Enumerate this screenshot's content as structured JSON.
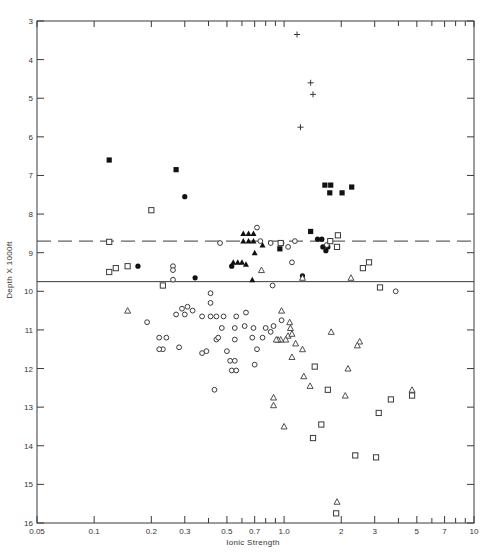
{
  "chart_data": {
    "type": "scatter",
    "title": "",
    "xlabel": "Ionic Strength",
    "ylabel": "Depth X 1000ft",
    "xscale": "log",
    "xlim": [
      0.05,
      10
    ],
    "ylim": [
      16,
      3
    ],
    "y_inverted": true,
    "grid": false,
    "legend": "none",
    "x_tick_labels": [
      "0.05",
      "0.1",
      "0.2",
      "0.3",
      "0.5",
      "0.7",
      "1.0",
      "2",
      "3",
      "5",
      "7",
      "10"
    ],
    "x_tick_values": [
      0.05,
      0.1,
      0.2,
      0.3,
      0.5,
      0.7,
      1.0,
      2,
      3,
      5,
      7,
      10
    ],
    "x_minor_ticks": [
      0.4,
      0.6,
      0.8,
      0.9,
      4,
      6,
      8,
      9
    ],
    "y_tick_labels": [
      "3",
      "4",
      "5",
      "6",
      "7",
      "8",
      "9",
      "10",
      "11",
      "12",
      "13",
      "14",
      "15",
      "16"
    ],
    "y_tick_values": [
      3,
      4,
      5,
      6,
      7,
      8,
      9,
      10,
      11,
      12,
      13,
      14,
      15,
      16
    ],
    "reference_lines": [
      {
        "style": "dashed",
        "depth": 8.7
      },
      {
        "style": "solid",
        "depth": 9.75
      }
    ],
    "series": [
      {
        "name": "plus",
        "marker": "plus",
        "points": [
          [
            1.17,
            3.35
          ],
          [
            1.38,
            4.6
          ],
          [
            1.42,
            4.9
          ],
          [
            1.22,
            5.75
          ]
        ]
      },
      {
        "name": "filled-square",
        "marker": "filled-square",
        "points": [
          [
            0.12,
            6.6
          ],
          [
            0.27,
            6.85
          ],
          [
            1.64,
            7.25
          ],
          [
            1.76,
            7.25
          ],
          [
            1.74,
            7.45
          ],
          [
            2.02,
            7.45
          ],
          [
            2.27,
            7.3
          ],
          [
            1.38,
            8.45
          ],
          [
            0.95,
            8.9
          ]
        ]
      },
      {
        "name": "filled-circle",
        "marker": "filled-circle",
        "points": [
          [
            0.3,
            7.55
          ],
          [
            0.17,
            9.35
          ],
          [
            0.53,
            9.35
          ],
          [
            0.34,
            9.65
          ],
          [
            1.5,
            8.65
          ],
          [
            1.58,
            8.65
          ],
          [
            1.6,
            8.85
          ],
          [
            1.66,
            8.95
          ],
          [
            1.7,
            8.85
          ],
          [
            1.25,
            9.6
          ]
        ]
      },
      {
        "name": "filled-triangle",
        "marker": "filled-triangle",
        "points": [
          [
            0.61,
            8.5
          ],
          [
            0.65,
            8.5
          ],
          [
            0.69,
            8.5
          ],
          [
            0.61,
            8.7
          ],
          [
            0.65,
            8.7
          ],
          [
            0.69,
            8.7
          ],
          [
            0.7,
            9.0
          ],
          [
            0.77,
            8.8
          ],
          [
            0.54,
            9.25
          ],
          [
            0.57,
            9.25
          ],
          [
            0.6,
            9.25
          ],
          [
            0.63,
            9.3
          ],
          [
            0.68,
            9.7
          ]
        ]
      },
      {
        "name": "open-circle",
        "marker": "open-circle",
        "points": [
          [
            0.72,
            8.35
          ],
          [
            0.75,
            8.7
          ],
          [
            0.46,
            8.75
          ],
          [
            0.97,
            8.75
          ],
          [
            1.05,
            8.85
          ],
          [
            1.14,
            8.7
          ],
          [
            0.85,
            8.75
          ],
          [
            1.68,
            8.8
          ],
          [
            0.26,
            9.35
          ],
          [
            0.26,
            9.45
          ],
          [
            0.26,
            9.7
          ],
          [
            1.1,
            9.25
          ],
          [
            0.87,
            9.85
          ],
          [
            3.87,
            10.0
          ],
          [
            0.41,
            10.05
          ],
          [
            0.41,
            10.3
          ],
          [
            0.31,
            10.4
          ],
          [
            0.29,
            10.45
          ],
          [
            0.33,
            10.5
          ],
          [
            0.3,
            10.6
          ],
          [
            0.27,
            10.6
          ],
          [
            0.37,
            10.65
          ],
          [
            0.41,
            10.65
          ],
          [
            0.44,
            10.65
          ],
          [
            0.48,
            10.65
          ],
          [
            0.56,
            10.65
          ],
          [
            0.19,
            10.8
          ],
          [
            0.63,
            10.55
          ],
          [
            0.24,
            11.2
          ],
          [
            0.22,
            11.2
          ],
          [
            0.44,
            11.25
          ],
          [
            0.55,
            11.25
          ],
          [
            0.39,
            11.55
          ],
          [
            0.37,
            11.6
          ],
          [
            0.5,
            11.55
          ],
          [
            0.68,
            11.2
          ],
          [
            0.7,
            11.9
          ],
          [
            0.77,
            11.2
          ],
          [
            0.72,
            11.5
          ],
          [
            0.23,
            11.5
          ],
          [
            0.22,
            11.5
          ],
          [
            0.28,
            11.45
          ],
          [
            0.45,
            11.2
          ],
          [
            0.52,
            11.8
          ],
          [
            0.55,
            11.8
          ],
          [
            0.62,
            10.9
          ],
          [
            0.69,
            10.95
          ],
          [
            0.8,
            10.95
          ],
          [
            0.85,
            11.05
          ],
          [
            0.88,
            10.9
          ],
          [
            0.97,
            10.75
          ],
          [
            0.53,
            12.05
          ],
          [
            0.56,
            12.05
          ],
          [
            0.43,
            12.55
          ],
          [
            0.47,
            10.95
          ],
          [
            0.55,
            10.95
          ]
        ]
      },
      {
        "name": "open-triangle",
        "marker": "open-triangle",
        "points": [
          [
            0.76,
            9.45
          ],
          [
            1.25,
            9.65
          ],
          [
            2.25,
            9.65
          ],
          [
            0.15,
            10.5
          ],
          [
            0.97,
            10.5
          ],
          [
            1.07,
            10.8
          ],
          [
            1.08,
            10.95
          ],
          [
            1.05,
            11.15
          ],
          [
            1.02,
            11.25
          ],
          [
            0.96,
            11.25
          ],
          [
            0.93,
            11.25
          ],
          [
            0.91,
            11.25
          ],
          [
            1.1,
            11.1
          ],
          [
            1.15,
            11.35
          ],
          [
            1.1,
            11.7
          ],
          [
            1.25,
            11.5
          ],
          [
            1.77,
            11.05
          ],
          [
            2.17,
            12.0
          ],
          [
            2.5,
            11.3
          ],
          [
            2.43,
            11.4
          ],
          [
            1.27,
            12.2
          ],
          [
            1.37,
            12.45
          ],
          [
            2.1,
            12.7
          ],
          [
            4.72,
            12.55
          ],
          [
            0.88,
            12.75
          ],
          [
            0.88,
            12.95
          ],
          [
            1.0,
            13.5
          ],
          [
            1.9,
            15.45
          ]
        ]
      },
      {
        "name": "open-square",
        "marker": "open-square",
        "points": [
          [
            0.12,
            8.72
          ],
          [
            0.2,
            7.9
          ],
          [
            0.12,
            9.5
          ],
          [
            0.13,
            9.4
          ],
          [
            0.15,
            9.35
          ],
          [
            0.23,
            9.85
          ],
          [
            0.96,
            8.75
          ],
          [
            1.92,
            8.55
          ],
          [
            1.9,
            8.85
          ],
          [
            1.75,
            8.7
          ],
          [
            2.6,
            9.4
          ],
          [
            2.8,
            9.25
          ],
          [
            3.2,
            9.9
          ],
          [
            1.45,
            11.95
          ],
          [
            1.7,
            12.55
          ],
          [
            1.42,
            13.8
          ],
          [
            1.57,
            13.45
          ],
          [
            2.37,
            14.25
          ],
          [
            3.05,
            14.3
          ],
          [
            3.15,
            13.15
          ],
          [
            3.65,
            12.8
          ],
          [
            4.72,
            12.7
          ],
          [
            1.88,
            15.75
          ]
        ]
      }
    ]
  },
  "axes": {
    "x_title": "Ionic Strength",
    "y_title": "Depth X 1000ft"
  }
}
